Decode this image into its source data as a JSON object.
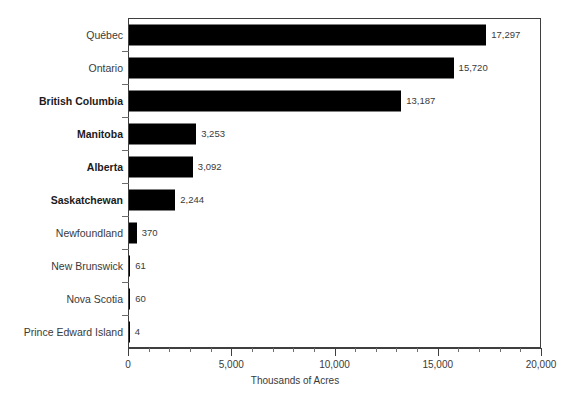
{
  "chart_data": {
    "type": "bar",
    "orientation": "horizontal",
    "title": "",
    "xlabel": "Thousands of Acres",
    "ylabel": "",
    "xlim": [
      0,
      20000
    ],
    "grid": false,
    "legend": null,
    "x_major_ticks": [
      0,
      5000,
      10000,
      15000,
      20000
    ],
    "x_major_tick_labels": [
      "0",
      "5,000",
      "10,000",
      "15,000",
      "20,000"
    ],
    "x_minor_tick_interval": 1000,
    "bar_color": "#000000",
    "categories": [
      "Québec",
      "Ontario",
      "British Columbia",
      "Manitoba",
      "Alberta",
      "Saskatchewan",
      "Newfoundland",
      "New Brunswick",
      "Nova Scotia",
      "Prince Edward Island"
    ],
    "values": [
      17297,
      15720,
      13187,
      3253,
      3092,
      2244,
      370,
      61,
      60,
      4
    ],
    "value_labels": [
      "17,297",
      "15,720",
      "13,187",
      "3,253",
      "3,092",
      "2,244",
      "370",
      "61",
      "60",
      "4"
    ],
    "emphasized_categories": [
      "British Columbia",
      "Manitoba",
      "Alberta",
      "Saskatchewan"
    ]
  }
}
